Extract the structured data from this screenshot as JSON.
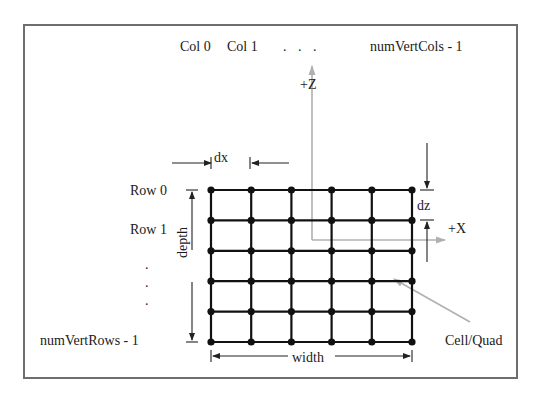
{
  "diagram": {
    "columns": {
      "col0": "Col 0",
      "col1": "Col 1",
      "ellipsis": ". . .",
      "last": "numVertCols - 1"
    },
    "rows": {
      "row0": "Row 0",
      "row1": "Row 1",
      "ellipsis": ".",
      "last": "numVertRows - 1"
    },
    "axes": {
      "z": "+Z",
      "x": "+X"
    },
    "dims": {
      "dx": "dx",
      "dz": "dz",
      "depth": "depth",
      "width": "width"
    },
    "callout": "Cell/Quad",
    "grid": {
      "vertex_cols": 6,
      "vertex_rows": 6
    },
    "colors": {
      "grid": "#111111",
      "axis": "#b0b0b0",
      "frame": "#6e6e6e",
      "text": "#1a1a1a"
    }
  }
}
